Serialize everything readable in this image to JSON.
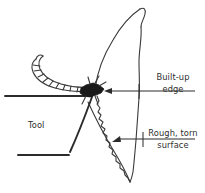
{
  "figure": {
    "background_color": "#ffffff",
    "ink_color": "#2b2b2b",
    "blob_color": "#1a1a1a"
  },
  "labels": {
    "tool": "Tool",
    "built_up_edge_line1": "Built-up",
    "built_up_edge_line2": "edge",
    "rough_surface_line1": "Rough, torn",
    "rough_surface_line2": "surface"
  },
  "parts": {
    "chip_name": "segmented curled chip",
    "tool_name": "cutting tool wedge",
    "workpiece_name": "workpiece material",
    "built_up_edge_name": "built-up edge deposit",
    "torn_surface_name": "rough torn machined surface"
  },
  "annotations": [
    {
      "id": "built-up-edge",
      "text_line1": "Built-up",
      "text_line2": "edge",
      "leader_from_x": 195,
      "leader_from_y": 91,
      "arrow_tip_x": 104,
      "arrow_tip_y": 91
    },
    {
      "id": "rough-torn-surface",
      "text_line1": "Rough, torn",
      "text_line2": "surface",
      "leader_from_x": 195,
      "leader_from_y": 139,
      "arrow_tip_x": 112,
      "arrow_tip_y": 142
    }
  ]
}
